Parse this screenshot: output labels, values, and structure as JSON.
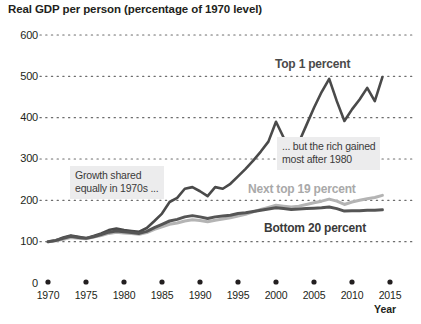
{
  "chart_data": {
    "type": "line",
    "title": "Real GDP per person (percentage of 1970 level)",
    "xlabel": "Year",
    "ylabel": "",
    "xlim": [
      1970,
      2015
    ],
    "ylim": [
      0,
      600
    ],
    "grid": "dotted-horizontal",
    "legend": "inline-labels",
    "yticks": [
      0,
      100,
      200,
      300,
      400,
      500,
      600
    ],
    "ytick_labels": [
      "0",
      "100",
      "200",
      "300",
      "400",
      "500",
      "600"
    ],
    "xticks": [
      1970,
      1975,
      1980,
      1985,
      1990,
      1995,
      2000,
      2005,
      2010,
      2015
    ],
    "xtick_labels": [
      "1970",
      "1975",
      "1980",
      "1985",
      "1990",
      "1995",
      "2000",
      "2005",
      "2010",
      "2015"
    ],
    "x": [
      1970,
      1971,
      1972,
      1973,
      1974,
      1975,
      1976,
      1977,
      1978,
      1979,
      1980,
      1981,
      1982,
      1983,
      1984,
      1985,
      1986,
      1987,
      1988,
      1989,
      1990,
      1991,
      1992,
      1993,
      1994,
      1995,
      1996,
      1997,
      1998,
      1999,
      2000,
      2001,
      2002,
      2003,
      2004,
      2005,
      2006,
      2007,
      2008,
      2009,
      2010,
      2011,
      2012,
      2013,
      2014
    ],
    "series": [
      {
        "name": "Top 1 percent",
        "color": "#4a4a4a",
        "label_position": "top-right",
        "values": [
          100,
          103,
          110,
          115,
          112,
          108,
          114,
          120,
          128,
          132,
          128,
          126,
          124,
          133,
          150,
          168,
          196,
          206,
          228,
          232,
          222,
          210,
          232,
          228,
          240,
          258,
          276,
          296,
          318,
          342,
          390,
          352,
          330,
          340,
          382,
          424,
          462,
          494,
          440,
          392,
          420,
          444,
          472,
          440,
          498
        ]
      },
      {
        "name": "Next top 19 percent",
        "color": "#b4b4b4",
        "label_position": "middle-right",
        "values": [
          100,
          102,
          106,
          110,
          108,
          107,
          111,
          115,
          120,
          123,
          121,
          120,
          118,
          122,
          130,
          136,
          142,
          145,
          150,
          153,
          151,
          148,
          152,
          155,
          158,
          162,
          166,
          172,
          178,
          183,
          188,
          186,
          184,
          186,
          190,
          194,
          198,
          203,
          198,
          190,
          196,
          200,
          204,
          207,
          212
        ]
      },
      {
        "name": "Bottom 20 percent",
        "color": "#555555",
        "label_position": "bottom-right",
        "values": [
          100,
          103,
          108,
          113,
          110,
          108,
          112,
          117,
          123,
          126,
          124,
          122,
          120,
          125,
          134,
          142,
          150,
          154,
          160,
          163,
          160,
          156,
          160,
          162,
          164,
          168,
          170,
          173,
          176,
          179,
          182,
          180,
          178,
          179,
          180,
          181,
          182,
          184,
          180,
          174,
          175,
          175,
          176,
          176,
          177
        ]
      }
    ],
    "annotations": [
      {
        "id": "growth-shared",
        "text": "Growth shared\nequally in 1970s ...",
        "line1": "Growth shared",
        "line2": "equally in 1970s ..."
      },
      {
        "id": "rich-gained",
        "text": "... but the rich gained\nmost after 1980",
        "line1": "... but the rich gained",
        "line2": "most after 1980"
      }
    ]
  },
  "labels": {
    "top1": "Top 1 percent",
    "next19": "Next top 19 percent",
    "bottom20": "Bottom 20 percent"
  }
}
